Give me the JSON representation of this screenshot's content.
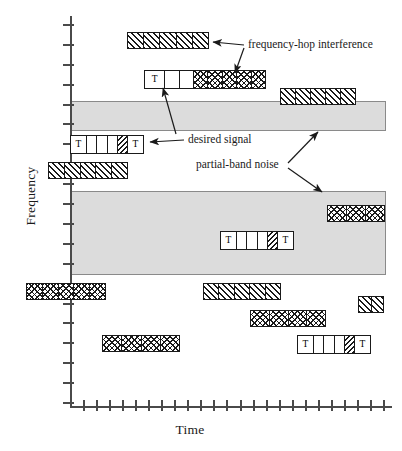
{
  "figure": {
    "type": "timing-diagram",
    "title": ""
  },
  "axes": {
    "y": {
      "label": "Frequency",
      "tick_count": 20,
      "ticks_labeled": false
    },
    "x": {
      "label": "Time",
      "tick_count": 24,
      "ticks_labeled": false
    }
  },
  "legend_callouts": [
    {
      "id": "fh",
      "label": "frequency-hop interference",
      "x": 248,
      "y": 44
    },
    {
      "id": "ds",
      "label": "desired signal",
      "x": 188,
      "y": 140
    },
    {
      "id": "pbn",
      "label": "partial-band noise",
      "x": 196,
      "y": 165
    }
  ],
  "colors": {
    "axis": "#4a4a4a",
    "ink": "#1a1a1a",
    "noise_fill": "#dcdcdc",
    "noise_edge": "#8a8a8a",
    "block_fill": "#ffffff"
  },
  "noise_bands": [
    {
      "name": "partial-band-noise-upper",
      "x": 70,
      "y": 101,
      "w": 315,
      "h": 28
    },
    {
      "name": "partial-band-noise-lower",
      "x": 70,
      "y": 191,
      "w": 315,
      "h": 82
    }
  ],
  "blocks": [
    {
      "name": "fh-interference-1",
      "kind": "interference",
      "pattern": "hatch-fwd",
      "x": 127,
      "y": 32,
      "w": 82,
      "h": 17,
      "cells": 5
    },
    {
      "name": "desired-signal-upper",
      "kind": "signal",
      "pattern": "mixed",
      "x": 144,
      "y": 70,
      "w": 122,
      "h": 19,
      "cell_list": [
        "T",
        "plain",
        "plain",
        "cross",
        "cross",
        "cross",
        "cross",
        "cross"
      ]
    },
    {
      "name": "fh-interference-2",
      "kind": "interference",
      "pattern": "hatch-fwd",
      "x": 280,
      "y": 88,
      "w": 76,
      "h": 17,
      "cells": 5
    },
    {
      "name": "desired-signal-main",
      "kind": "signal",
      "pattern": "mixed",
      "x": 70,
      "y": 135,
      "w": 74,
      "h": 19,
      "cell_list": [
        "T",
        "plain",
        "plain",
        "plain",
        "back",
        "T"
      ]
    },
    {
      "name": "fh-interference-3",
      "kind": "interference",
      "pattern": "hatch-fwd",
      "x": 48,
      "y": 162,
      "w": 80,
      "h": 17,
      "cells": 5
    },
    {
      "name": "fh-interference-4",
      "kind": "interference",
      "pattern": "hatch-cross",
      "x": 327,
      "y": 205,
      "w": 58,
      "h": 17,
      "cells": 3
    },
    {
      "name": "desired-signal-lower",
      "kind": "signal",
      "pattern": "mixed",
      "x": 220,
      "y": 231,
      "w": 74,
      "h": 19,
      "cell_list": [
        "T",
        "plain",
        "plain",
        "plain",
        "back",
        "T"
      ]
    },
    {
      "name": "fh-interference-5",
      "kind": "interference",
      "pattern": "hatch-cross",
      "x": 26,
      "y": 283,
      "w": 80,
      "h": 17,
      "cells": 5
    },
    {
      "name": "fh-interference-6",
      "kind": "interference",
      "pattern": "hatch-fwd",
      "x": 203,
      "y": 283,
      "w": 78,
      "h": 17,
      "cells": 5
    },
    {
      "name": "fh-interference-7",
      "kind": "interference",
      "pattern": "hatch-fwd",
      "x": 358,
      "y": 296,
      "w": 26,
      "h": 17,
      "cells": 2
    },
    {
      "name": "fh-interference-8",
      "kind": "interference",
      "pattern": "hatch-cross",
      "x": 250,
      "y": 310,
      "w": 76,
      "h": 17,
      "cells": 4
    },
    {
      "name": "fh-interference-9",
      "kind": "interference",
      "pattern": "hatch-cross",
      "x": 102,
      "y": 335,
      "w": 78,
      "h": 17,
      "cells": 4
    },
    {
      "name": "desired-signal-bottom",
      "kind": "signal",
      "pattern": "mixed",
      "x": 297,
      "y": 335,
      "w": 74,
      "h": 19,
      "cell_list": [
        "T",
        "plain",
        "plain",
        "plain",
        "back",
        "T"
      ]
    }
  ],
  "labels": {
    "t_mark": "T"
  }
}
